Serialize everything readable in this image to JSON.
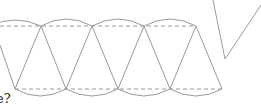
{
  "diagram": {
    "type": "net-of-solid",
    "stroke_color": "#9a9a9a",
    "dash_color": "#9a9a9a",
    "top_vertices": [
      [
        41,
        26
      ],
      [
        92,
        26
      ],
      [
        144,
        26
      ],
      [
        196,
        26
      ]
    ],
    "bottom_vertices": [
      [
        15,
        89
      ],
      [
        66,
        89
      ],
      [
        118,
        89
      ],
      [
        170,
        89
      ],
      [
        222,
        89
      ]
    ],
    "top_arc_peak_y": 19,
    "bottom_arc_trough_y": 96,
    "side_shape": {
      "points": [
        [
          213,
          0
        ],
        [
          225,
          59
        ],
        [
          261,
          5
        ]
      ]
    },
    "caption_fragment": "e?"
  }
}
